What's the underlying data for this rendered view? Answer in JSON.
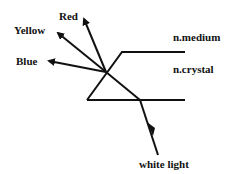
{
  "diagram": {
    "labels": {
      "red": "Red",
      "yellow": "Yellow",
      "blue": "Blue",
      "medium": "n.medium",
      "crystal": "n.crystal",
      "source": "white light"
    },
    "colors": {
      "stroke": "#111111",
      "background": "#ffffff"
    }
  }
}
